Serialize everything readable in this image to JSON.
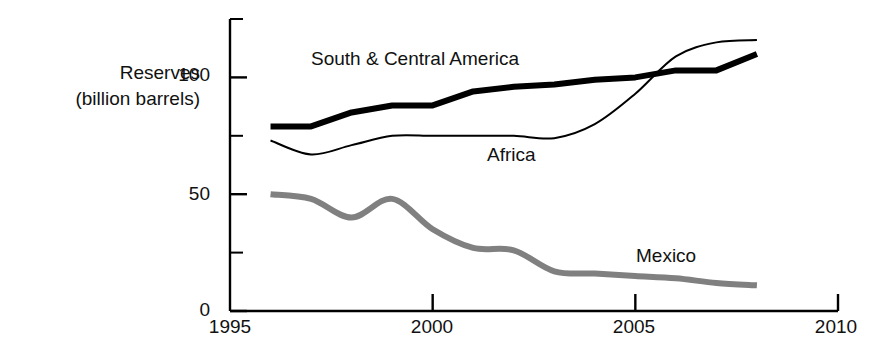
{
  "chart_data": {
    "type": "line",
    "title": "",
    "subtitle": "",
    "xlabel": "",
    "ylabel": "Reserves (billion barrels)",
    "ylabel_line1": "Reserves",
    "ylabel_line2": "(billion barrels)",
    "xlim": [
      1995,
      2010
    ],
    "ylim": [
      0,
      125
    ],
    "grid": false,
    "legend_position": "inline-annotations",
    "x_ticks": [
      1995,
      2000,
      2005,
      2010
    ],
    "x_tick_labels": [
      "1995",
      "2000",
      "2005",
      "2010"
    ],
    "y_ticks": [
      0,
      25,
      50,
      75,
      100,
      125
    ],
    "y_tick_labels": [
      "0",
      "",
      "50",
      "",
      "100",
      ""
    ],
    "y_major_ticks": [
      0,
      50,
      100
    ],
    "y_minor_ticks": [
      25,
      75,
      125
    ],
    "annotations": [
      {
        "text": "South & Central America",
        "x": 1999.6,
        "y": 112
      },
      {
        "text": "Africa",
        "x": 2002.6,
        "y": 68
      },
      {
        "text": "Mexico",
        "x": 2006.4,
        "y": 26
      }
    ],
    "series": [
      {
        "name": "South & Central America",
        "color": "#000000",
        "style": "thick-solid",
        "line_width": 6,
        "x": [
          1996,
          1997,
          1998,
          1999,
          2000,
          2001,
          2002,
          2003,
          2004,
          2005,
          2006,
          2007,
          2008
        ],
        "values": [
          79,
          79,
          85,
          88,
          88,
          94,
          96,
          97,
          99,
          100,
          103,
          103,
          110
        ]
      },
      {
        "name": "Africa",
        "color": "#000000",
        "style": "thin-solid",
        "line_width": 2,
        "x": [
          1996,
          1997,
          1998,
          1999,
          2000,
          2001,
          2002,
          2003,
          2004,
          2005,
          2006,
          2007,
          2008
        ],
        "values": [
          73,
          67,
          71,
          75,
          75,
          75,
          75,
          74,
          80,
          93,
          109,
          115,
          116
        ]
      },
      {
        "name": "Mexico",
        "color": "#808080",
        "style": "thick-solid-gray",
        "line_width": 6,
        "x": [
          1996,
          1997,
          1998,
          1999,
          2000,
          2001,
          2002,
          2003,
          2004,
          2005,
          2006,
          2007,
          2008
        ],
        "values": [
          50,
          48,
          40,
          48,
          35,
          27,
          26,
          17,
          16,
          15,
          14,
          12,
          11
        ]
      }
    ]
  }
}
